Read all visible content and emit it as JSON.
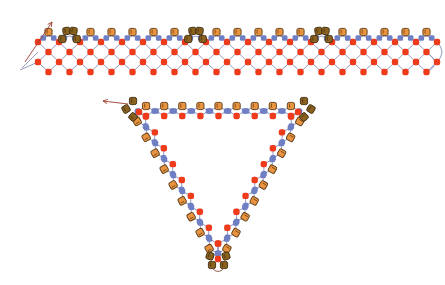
{
  "diagram": {
    "type": "beadwork-pattern",
    "colors": {
      "background": "#ffffff",
      "thread": "#8a8fb8",
      "thread_dark": "#7a3a2a",
      "red_bead": "#ee3b1c",
      "blue_bead": "#6f7fc4",
      "orange_cylinder": "#e8933f",
      "orange_cylinder_outline": "#5a3a16",
      "brown_cylinder": "#8a6220",
      "brown_cylinder_outline": "#3d2a0c",
      "arrow": "#9b3a2c"
    },
    "strip": {
      "name": "flat-netted-strip",
      "x_start": 30,
      "x_end": 425,
      "top_y": 32,
      "repeat_count": 19,
      "pitch": 21,
      "rows_of_netting": 3,
      "dark_groups_at": [
        1,
        7,
        13
      ]
    },
    "triangle": {
      "name": "netted-triangle",
      "vertices": [
        [
          125,
          107
        ],
        [
          312,
          107
        ],
        [
          218,
          268
        ]
      ],
      "beads_per_side": 9
    },
    "arrows": [
      {
        "name": "strip-start-arrow",
        "from": [
          25,
          62
        ],
        "to": [
          52,
          22
        ]
      },
      {
        "name": "triangle-start-arrow",
        "from": [
          128,
          104
        ],
        "to": [
          103,
          101
        ]
      }
    ]
  }
}
